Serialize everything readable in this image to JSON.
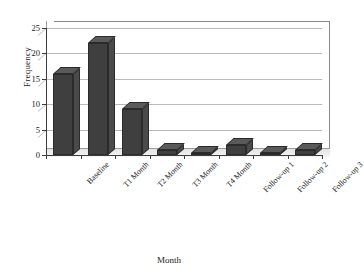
{
  "chart_data": {
    "type": "bar",
    "title": "",
    "xlabel": "Month",
    "ylabel": "Frequency",
    "categories": [
      "Baseline",
      "T1 Month",
      "T2 Month",
      "T3 Month",
      "T4 Month",
      "Follow-up 1",
      "Follow-up 2",
      "Follow-up 3"
    ],
    "values": [
      16,
      22,
      9,
      1,
      0,
      2,
      0,
      1
    ],
    "ylim": [
      0,
      25
    ],
    "yticks": [
      0,
      5,
      10,
      15,
      20,
      25
    ],
    "ytick_labels": [
      "0",
      "5",
      "10",
      "15",
      "20",
      "25"
    ],
    "grid": "horizontal",
    "legend": "none",
    "bar_color": "#3f3f3f",
    "style": "3d-column"
  }
}
